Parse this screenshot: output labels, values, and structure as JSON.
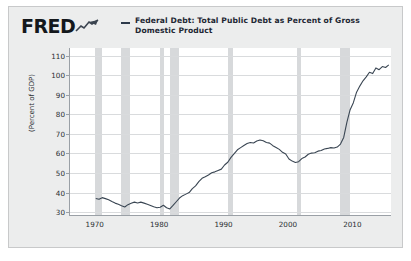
{
  "header": {
    "logo": "FRED",
    "logo_icon": "fred-squiggle-icon",
    "legend_dash_icon": "legend-line-swatch",
    "series_label": "Federal Debt: Total Public Debt as Percent of Gross Domestic Product"
  },
  "colors": {
    "card_background": "#eceded",
    "plot_background": "#ffffff",
    "series_line": "#3a4653",
    "recession_band": "#d7d9db",
    "gridline": "#d9dbdd",
    "axis": "#9aa0a6",
    "text": "#2b2f33"
  },
  "chart_data": {
    "type": "line",
    "title": "Federal Debt: Total Public Debt as Percent of Gross Domestic Product",
    "xlabel": "",
    "ylabel": "(Percent of GDP)",
    "xlim": [
      1966,
      2016
    ],
    "ylim": [
      28,
      114
    ],
    "ytick_labels": [
      "110",
      "100",
      "90",
      "80",
      "70",
      "60",
      "50",
      "40",
      "30"
    ],
    "yticks": [
      110,
      100,
      90,
      80,
      70,
      60,
      50,
      40,
      30
    ],
    "xtick_labels": [
      "1970",
      "1980",
      "1990",
      "2000",
      "2010"
    ],
    "xticks": [
      1970,
      1980,
      1990,
      2000,
      2010
    ],
    "grid": "horizontal",
    "legend_position": "top",
    "series": [
      {
        "name": "Federal Debt: Total Public Debt as Percent of Gross Domestic Product",
        "color": "#3a4653",
        "x": [
          1970.0,
          1970.5,
          1971.0,
          1971.5,
          1972.0,
          1972.5,
          1973.0,
          1973.5,
          1974.0,
          1974.5,
          1975.0,
          1975.5,
          1976.0,
          1976.5,
          1977.0,
          1977.5,
          1978.0,
          1978.5,
          1979.0,
          1979.5,
          1980.0,
          1980.5,
          1981.0,
          1981.5,
          1982.0,
          1982.5,
          1983.0,
          1983.5,
          1984.0,
          1984.5,
          1985.0,
          1985.5,
          1986.0,
          1986.5,
          1987.0,
          1987.5,
          1988.0,
          1988.5,
          1989.0,
          1989.5,
          1990.0,
          1990.5,
          1991.0,
          1991.5,
          1992.0,
          1992.5,
          1993.0,
          1993.5,
          1994.0,
          1994.5,
          1995.0,
          1995.5,
          1996.0,
          1996.5,
          1997.0,
          1997.5,
          1998.0,
          1998.5,
          1999.0,
          1999.5,
          2000.0,
          2000.5,
          2001.0,
          2001.5,
          2002.0,
          2002.5,
          2003.0,
          2003.5,
          2004.0,
          2004.5,
          2005.0,
          2005.5,
          2006.0,
          2006.5,
          2007.0,
          2007.5,
          2008.0,
          2008.5,
          2009.0,
          2009.5,
          2010.0,
          2010.5,
          2011.0,
          2011.5,
          2012.0,
          2012.5,
          2013.0,
          2013.5,
          2014.0,
          2014.5,
          2015.0,
          2015.5
        ],
        "y": [
          37.0,
          36.6,
          37.4,
          36.9,
          36.3,
          35.4,
          34.6,
          34.0,
          33.2,
          32.6,
          33.8,
          34.5,
          35.1,
          34.7,
          35.1,
          34.6,
          34.0,
          33.4,
          32.7,
          32.2,
          32.5,
          33.5,
          32.2,
          31.6,
          33.4,
          35.3,
          37.2,
          38.4,
          39.2,
          40.0,
          42.0,
          43.4,
          45.6,
          47.3,
          48.1,
          49.0,
          50.1,
          50.6,
          51.3,
          52.0,
          54.1,
          55.5,
          58.0,
          59.9,
          61.9,
          63.0,
          64.1,
          65.1,
          65.6,
          65.4,
          66.4,
          66.9,
          66.5,
          65.6,
          65.3,
          64.0,
          63.1,
          62.1,
          60.6,
          59.7,
          57.2,
          56.1,
          55.4,
          55.8,
          57.4,
          58.2,
          59.6,
          60.2,
          60.4,
          61.2,
          61.5,
          62.3,
          62.6,
          63.0,
          62.8,
          63.3,
          64.8,
          68.2,
          76.1,
          82.4,
          86.0,
          91.4,
          94.5,
          97.2,
          99.2,
          101.6,
          100.9,
          103.8,
          102.9,
          104.5,
          104.0,
          105.4
        ]
      }
    ],
    "recession_bands": [
      {
        "start": 1969.92,
        "end": 1970.92
      },
      {
        "start": 1973.92,
        "end": 1975.25
      },
      {
        "start": 1980.0,
        "end": 1980.58
      },
      {
        "start": 1981.5,
        "end": 1982.92
      },
      {
        "start": 1990.5,
        "end": 1991.25
      },
      {
        "start": 2001.25,
        "end": 2001.92
      },
      {
        "start": 2007.92,
        "end": 2009.5
      }
    ]
  }
}
